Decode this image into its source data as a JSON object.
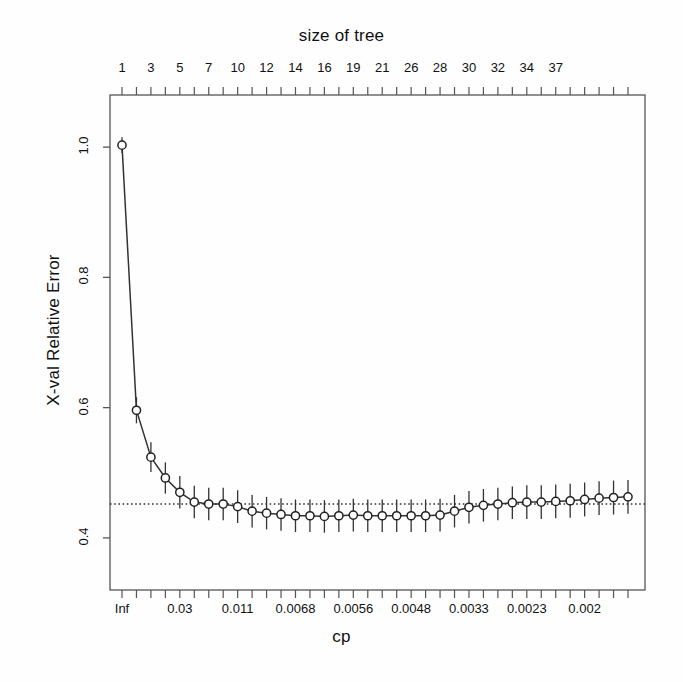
{
  "chart_data": {
    "type": "line",
    "title": "size of tree",
    "xlabel": "cp",
    "ylabel": "X-val Relative Error",
    "grid": false,
    "legend": null,
    "ylim": [
      0.32,
      1.08
    ],
    "yticks": [
      "1.0",
      "0.8",
      "0.6",
      "0.4"
    ],
    "ytick_values": [
      1.0,
      0.8,
      0.6,
      0.4
    ],
    "top_axis_label": "size of tree",
    "top_tick_labels": [
      "1",
      "3",
      "5",
      "7",
      "10",
      "12",
      "14",
      "16",
      "19",
      "21",
      "26",
      "28",
      "30",
      "32",
      "34",
      "37"
    ],
    "top_tick_indices": [
      0,
      2,
      4,
      6,
      8,
      10,
      12,
      14,
      16,
      18,
      20,
      22,
      24,
      26,
      28,
      30
    ],
    "bottom_axis_label": "cp",
    "bottom_tick_labels": [
      "Inf",
      "0.03",
      "0.011",
      "0.0068",
      "0.0056",
      "0.0048",
      "0.0033",
      "0.0023",
      "0.002"
    ],
    "bottom_tick_indices": [
      0,
      4,
      8,
      12,
      16,
      20,
      24,
      28,
      32
    ],
    "reference_line": 0.452,
    "reference_line_style": "dotted",
    "n_points": 36,
    "point_marker": "open-circle",
    "x": [
      1,
      2,
      3,
      4,
      5,
      6,
      7,
      8,
      9,
      10,
      11,
      12,
      13,
      14,
      15,
      16,
      17,
      18,
      19,
      20,
      21,
      22,
      23,
      24,
      25,
      26,
      27,
      28,
      29,
      30,
      31,
      32,
      33,
      34,
      35,
      36
    ],
    "sizes_of_tree": [
      1,
      2,
      3,
      4,
      5,
      6,
      7,
      8,
      9,
      10,
      11,
      12,
      13,
      14,
      15,
      16,
      17,
      18,
      19,
      20,
      21,
      22,
      23,
      24,
      25,
      26,
      27,
      28,
      29,
      30,
      31,
      32,
      33,
      34,
      35,
      37
    ],
    "values": [
      1.003,
      0.596,
      0.524,
      0.492,
      0.47,
      0.455,
      0.452,
      0.452,
      0.448,
      0.441,
      0.438,
      0.436,
      0.434,
      0.434,
      0.433,
      0.434,
      0.435,
      0.434,
      0.434,
      0.434,
      0.434,
      0.434,
      0.435,
      0.441,
      0.447,
      0.45,
      0.452,
      0.454,
      0.455,
      0.455,
      0.456,
      0.457,
      0.459,
      0.461,
      0.462,
      0.463
    ],
    "errors": [
      0.012,
      0.02,
      0.023,
      0.024,
      0.025,
      0.025,
      0.025,
      0.025,
      0.025,
      0.025,
      0.025,
      0.025,
      0.025,
      0.025,
      0.025,
      0.025,
      0.025,
      0.025,
      0.025,
      0.025,
      0.025,
      0.025,
      0.025,
      0.025,
      0.025,
      0.025,
      0.025,
      0.025,
      0.026,
      0.026,
      0.026,
      0.026,
      0.026,
      0.026,
      0.026,
      0.026
    ],
    "colors": {
      "line": "#333333",
      "marker": "#222222",
      "errorbar": "#333333",
      "axis": "#555555",
      "reference": "#333333",
      "background": "#fefefe"
    }
  }
}
